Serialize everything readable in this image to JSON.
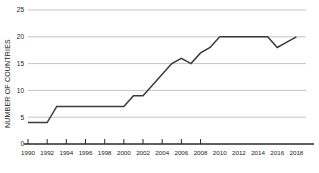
{
  "chart_data": {
    "type": "line",
    "title": "",
    "xlabel": "",
    "ylabel": "NUMBER OF COUNTRIES",
    "xlim": [
      1990,
      2019
    ],
    "ylim": [
      0,
      25
    ],
    "grid": true,
    "legend": "none",
    "yticks": [
      0,
      5,
      10,
      15,
      20,
      25
    ],
    "ytick_labels": [
      "0",
      "5",
      "10",
      "15",
      "20",
      "25"
    ],
    "xticks": [
      1990,
      1992,
      1994,
      1996,
      1998,
      2000,
      2002,
      2004,
      2006,
      2008,
      2010,
      2012,
      2014,
      2016,
      2018
    ],
    "xtick_labels": [
      "1990",
      "1992",
      "1994",
      "1996",
      "1998",
      "2000",
      "2002",
      "2004",
      "2006",
      "2008",
      "2010",
      "2012",
      "2014",
      "2016",
      "2018"
    ],
    "tick_marks_through": 2008,
    "series": [
      {
        "name": "Number of countries",
        "color": "#3a3a3a",
        "x": [
          1990,
          1991,
          1992,
          1993,
          1994,
          1995,
          1996,
          1997,
          1998,
          1999,
          2000,
          2001,
          2002,
          2003,
          2004,
          2005,
          2006,
          2007,
          2008,
          2009,
          2010,
          2011,
          2012,
          2013,
          2014,
          2015,
          2016,
          2017,
          2018
        ],
        "values": [
          4,
          4,
          4,
          7,
          7,
          7,
          7,
          7,
          7,
          7,
          7,
          9,
          9,
          11,
          13,
          15,
          16,
          15,
          17,
          18,
          20,
          20,
          20,
          20,
          20,
          20,
          18,
          19,
          20
        ]
      }
    ]
  },
  "colors": {
    "line": "#3a3a3a",
    "grid": "#b4b4b4",
    "axis": "#2a2a2a",
    "text": "#1a1a1a",
    "background": "#ffffff"
  }
}
